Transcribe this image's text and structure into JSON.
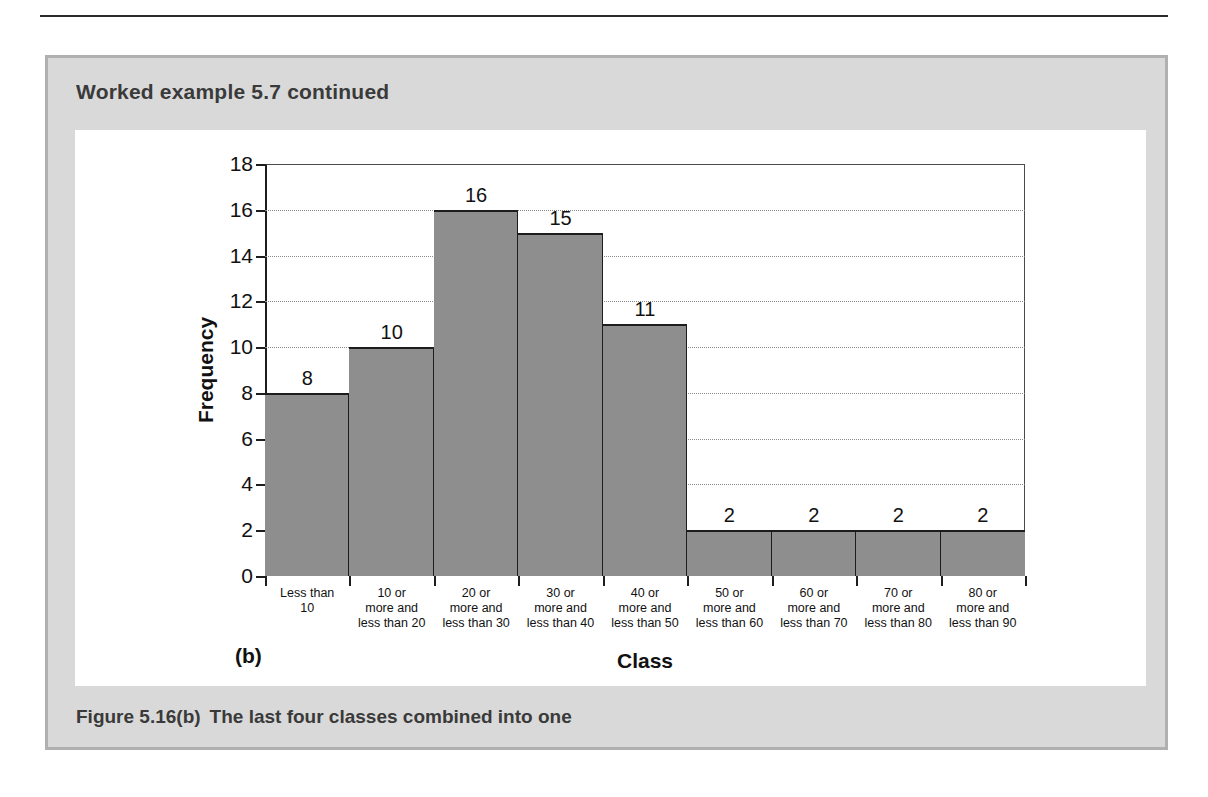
{
  "page": {
    "example_title": "Worked example 5.7 continued",
    "figure_caption_number": "Figure 5.16(b)",
    "figure_caption_text": "The last four classes combined into one",
    "panel_letter": "(b)",
    "colors": {
      "bar_fill": "#8e8e8e",
      "bar_outline": "#1d1d1d",
      "box_background": "#d9d9d9",
      "box_border": "#b0b0b0",
      "panel_background": "#ffffff",
      "gridline": "#8a8a8a"
    }
  },
  "chart_data": {
    "type": "bar",
    "title": "",
    "xlabel": "Class",
    "ylabel": "Frequency",
    "ylim": [
      0,
      18
    ],
    "yticks": [
      0,
      2,
      4,
      6,
      8,
      10,
      12,
      14,
      16,
      18
    ],
    "grid": true,
    "legend": "none",
    "categories": [
      "Less than\n10",
      "10 or\nmore and\nless than 20",
      "20 or\nmore and\nless than 30",
      "30 or\nmore and\nless than 40",
      "40 or\nmore and\nless than 50",
      "50 or\nmore and\nless than 60",
      "60 or\nmore and\nless than 70",
      "70 or\nmore and\nless than 80",
      "80 or\nmore and\nless than 90"
    ],
    "category_lines": [
      [
        "Less than",
        "10"
      ],
      [
        "10 or",
        "more and",
        "less than 20"
      ],
      [
        "20 or",
        "more and",
        "less than 30"
      ],
      [
        "30 or",
        "more and",
        "less than 40"
      ],
      [
        "40 or",
        "more and",
        "less than 50"
      ],
      [
        "50 or",
        "more and",
        "less than 60"
      ],
      [
        "60 or",
        "more and",
        "less than 70"
      ],
      [
        "70 or",
        "more and",
        "less than 80"
      ],
      [
        "80 or",
        "more and",
        "less than 90"
      ]
    ],
    "values": [
      8,
      10,
      16,
      15,
      11,
      2,
      2,
      2,
      2
    ],
    "data_labels": [
      "8",
      "10",
      "16",
      "15",
      "11",
      "2",
      "2",
      "2",
      "2"
    ]
  }
}
